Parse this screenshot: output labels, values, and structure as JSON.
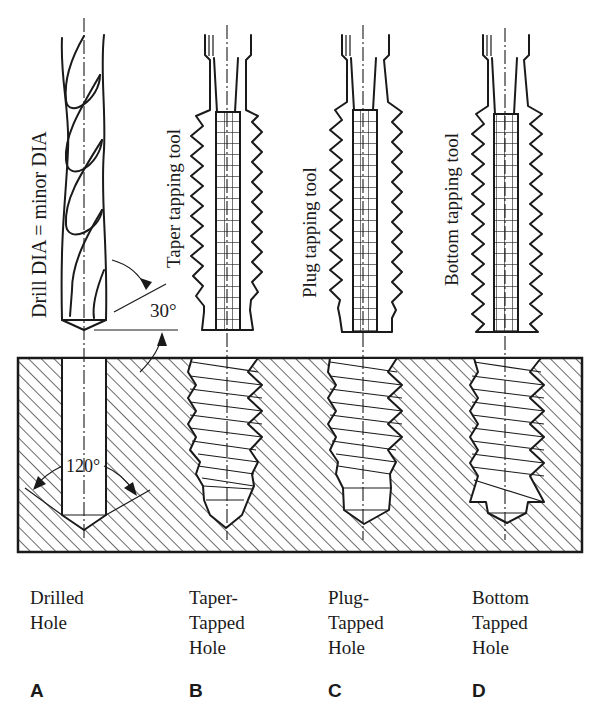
{
  "figure": {
    "panels": [
      {
        "letter": "A",
        "caption_lines": [
          "Drilled",
          "Hole"
        ],
        "tool_label": "Drill DIA = minor DIA"
      },
      {
        "letter": "B",
        "caption_lines": [
          "Taper-",
          "Tapped",
          "Hole"
        ],
        "tool_label": "Taper tapping tool"
      },
      {
        "letter": "C",
        "caption_lines": [
          "Plug-",
          "Tapped",
          "Hole"
        ],
        "tool_label": "Plug tapping tool"
      },
      {
        "letter": "D",
        "caption_lines": [
          "Bottom",
          "Tapped",
          "Hole"
        ],
        "tool_label": "Bottom tapping tool"
      }
    ],
    "annotations": {
      "chamfer_angle": "30°",
      "drill_point_angle": "120°"
    },
    "colors": {
      "ink": "#1a1a1a",
      "background": "#ffffff"
    }
  }
}
